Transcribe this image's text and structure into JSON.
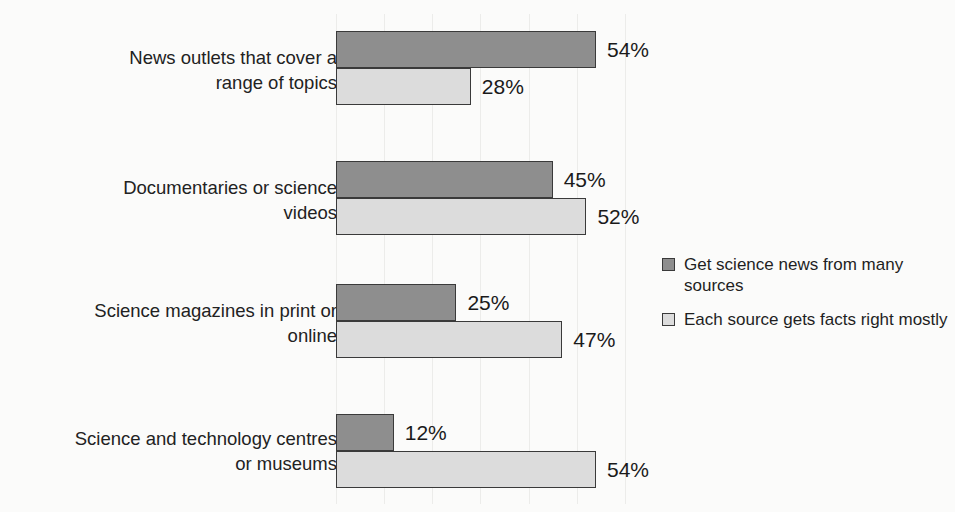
{
  "chart_data": {
    "type": "bar",
    "orientation": "horizontal",
    "grouped": true,
    "title": "",
    "subtitle": "",
    "xlabel": "",
    "ylabel": "",
    "xlim": [
      0,
      60
    ],
    "grid": true,
    "gridline_interval": 10,
    "value_label_suffix": "%",
    "legend_position": "right",
    "colors": {
      "many_sources": "#8e8e8e",
      "facts_right": "#dcdcdc",
      "bar_border": "#3a3a3a",
      "gridline": "#ececea",
      "background": "#fbfbfa",
      "text": "#1c1c1c"
    },
    "categories": [
      "News outlets that cover a\nrange of topics",
      "Documentaries or science\nvideos",
      "Science magazines in print or\nonline",
      "Science and technology centres\nor museums"
    ],
    "series": [
      {
        "name": "Get science news from many sources",
        "key": "many",
        "values": [
          54,
          45,
          25,
          12
        ],
        "labels": [
          "54%",
          "45%",
          "25%",
          "12%"
        ]
      },
      {
        "name": "Each source gets facts right mostly",
        "key": "facts",
        "values": [
          28,
          52,
          47,
          54
        ],
        "labels": [
          "28%",
          "52%",
          "47%",
          "54%"
        ]
      }
    ]
  },
  "legend": {
    "items": [
      {
        "label": "Get science news from many sources",
        "key": "many"
      },
      {
        "label": "Each source gets facts right mostly",
        "key": "facts"
      }
    ]
  }
}
